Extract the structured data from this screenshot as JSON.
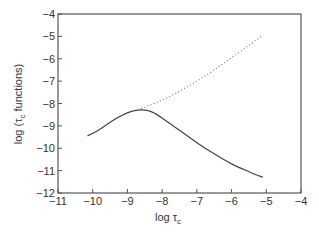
{
  "chart_data": {
    "type": "line",
    "title": "",
    "xlabel": "log τc",
    "ylabel": "log (τc functions)",
    "xlim": [
      -11,
      -4
    ],
    "ylim": [
      -12,
      -4
    ],
    "x_ticks": [
      "-11",
      "-10",
      "-9",
      "-8",
      "-7",
      "-6",
      "-5",
      "-4"
    ],
    "y_ticks": [
      "-4",
      "-5",
      "-6",
      "-7",
      "-8",
      "-9",
      "-10",
      "-11",
      "-12"
    ],
    "grid": false,
    "legend": null,
    "series": [
      {
        "name": "solid",
        "style": "solid",
        "x": [
          -10.15,
          -9.9,
          -9.6,
          -9.3,
          -9.0,
          -8.8,
          -8.6,
          -8.4,
          -8.2,
          -8.0,
          -7.5,
          -7.0,
          -6.5,
          -6.0,
          -5.5,
          -5.1
        ],
        "y": [
          -9.45,
          -9.25,
          -8.95,
          -8.65,
          -8.42,
          -8.32,
          -8.28,
          -8.32,
          -8.45,
          -8.65,
          -9.2,
          -9.75,
          -10.25,
          -10.7,
          -11.05,
          -11.3
        ]
      },
      {
        "name": "dotted",
        "style": "dotted",
        "x": [
          -8.7,
          -8.4,
          -8.0,
          -7.5,
          -7.0,
          -6.5,
          -6.0,
          -5.5,
          -5.1
        ],
        "y": [
          -8.28,
          -8.1,
          -7.85,
          -7.45,
          -7.0,
          -6.5,
          -5.95,
          -5.4,
          -4.95
        ]
      }
    ]
  },
  "labels": {
    "xlabel_main": "log τ",
    "xlabel_sub": "c",
    "ylabel_prefix": "log (τ",
    "ylabel_sub": "c",
    "ylabel_suffix": " functions)"
  }
}
